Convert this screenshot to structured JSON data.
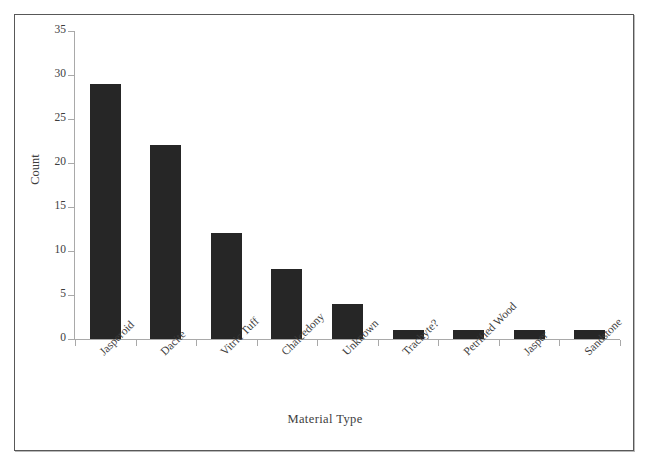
{
  "chart_data": {
    "type": "bar",
    "title": "",
    "xlabel": "Material Type",
    "ylabel": "Count",
    "categories": [
      "Jasperoid",
      "Dacite",
      "Vitric Tuff",
      "Chalcedony",
      "Unknown",
      "Trachyte?",
      "Petrified Wood",
      "Jasper",
      "Sandstone"
    ],
    "values": [
      29,
      22,
      12,
      8,
      4,
      1,
      1,
      1,
      1
    ],
    "ylim": [
      0,
      35
    ],
    "yticks": [
      0,
      5,
      10,
      15,
      20,
      25,
      30,
      35
    ],
    "ytick_labels": [
      "0",
      "5",
      "10",
      "15",
      "20",
      "25",
      "30",
      "35"
    ],
    "grid": false,
    "legend": null,
    "bar_color": "#262626",
    "axis_color": "#a9a9a9",
    "background_color": "#ffffff",
    "frame_color": "#585858",
    "xtick_label_rotation": -45
  }
}
